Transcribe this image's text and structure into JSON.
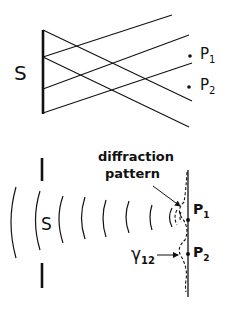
{
  "top_panel": {
    "source_label": "S",
    "points": [
      {
        "label": "P",
        "sub": "1"
      },
      {
        "label": "P",
        "sub": "2"
      }
    ]
  },
  "bottom_panel": {
    "source_label": "S",
    "annotation_line1": "diffraction",
    "annotation_line2": "pattern",
    "gamma_label": "γ",
    "gamma_sub": "12",
    "points": [
      {
        "label": "P",
        "sub": "1"
      },
      {
        "label": "P",
        "sub": "2"
      }
    ]
  },
  "colors": {
    "ink": "#111111",
    "background": "#ffffff"
  }
}
